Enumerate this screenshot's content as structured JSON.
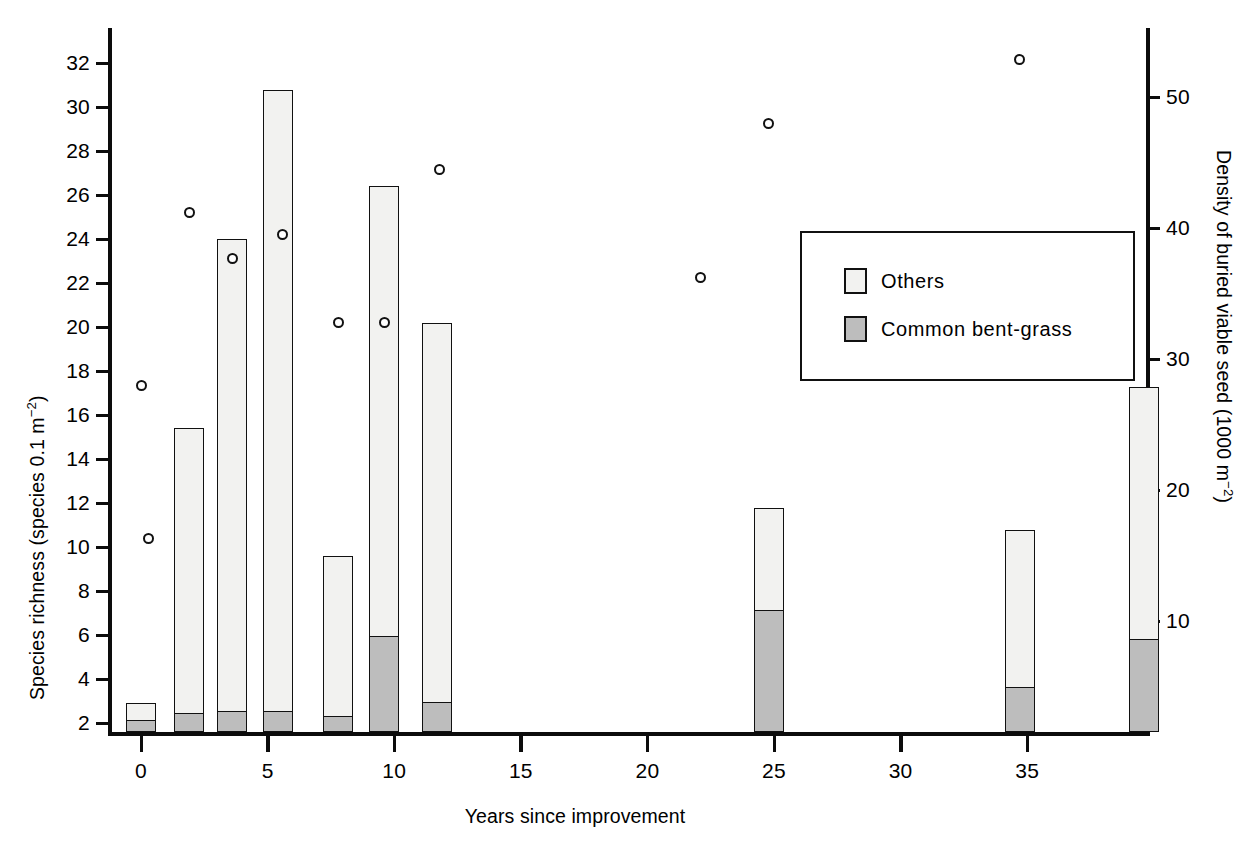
{
  "chart_data": {
    "type": "bar",
    "title": "",
    "xlabel": "Years since improvement",
    "ylabel": "Species richness (species 0.1 m⁻²)",
    "y2label": "Density of buried viable seed (1000 m⁻²)",
    "xlim": [
      -1.5,
      40
    ],
    "ylim": [
      0,
      33
    ],
    "y2lim": [
      0,
      55
    ],
    "grid": false,
    "legend_position": "upper right",
    "xticks": [
      0,
      5,
      10,
      15,
      20,
      25,
      30,
      35
    ],
    "xtick_labels": [
      "0",
      "5",
      "10",
      "15",
      "20",
      "25",
      "30",
      "35"
    ],
    "yticks": [
      2,
      4,
      6,
      8,
      10,
      12,
      14,
      16,
      18,
      20,
      22,
      24,
      26,
      28,
      30,
      32
    ],
    "ytick_labels": [
      "2",
      "4",
      "6",
      "8",
      "10",
      "12",
      "14",
      "16",
      "18",
      "20",
      "22",
      "24",
      "26",
      "28",
      "30",
      "32"
    ],
    "y2ticks": [
      10,
      20,
      30,
      40,
      50
    ],
    "y2tick_labels": [
      "10",
      "20",
      "30",
      "40",
      "50"
    ],
    "series": [
      {
        "name": "Common bent-grass",
        "color": "#bdbdbd",
        "values": [
          0.5,
          0.8,
          0.9,
          0.9,
          0.7,
          4.3,
          1.3,
          5.5,
          2.0,
          4.2
        ]
      },
      {
        "name": "Others",
        "color": "#f2f2f0",
        "values": [
          0.8,
          13.0,
          21.5,
          28.3,
          7.3,
          20.5,
          17.3,
          4.7,
          7.2,
          11.5
        ]
      }
    ],
    "bars": [
      {
        "x": 0.0,
        "total": 1.3,
        "bent_grass": 0.5,
        "others": 0.8
      },
      {
        "x": 1.9,
        "total": 13.8,
        "bent_grass": 0.8,
        "others": 13.0
      },
      {
        "x": 3.6,
        "total": 22.4,
        "bent_grass": 0.9,
        "others": 21.5
      },
      {
        "x": 5.4,
        "total": 29.2,
        "bent_grass": 0.9,
        "others": 28.3
      },
      {
        "x": 7.8,
        "total": 8.0,
        "bent_grass": 0.7,
        "others": 7.3
      },
      {
        "x": 9.6,
        "total": 24.8,
        "bent_grass": 4.3,
        "others": 20.5
      },
      {
        "x": 11.7,
        "total": 18.6,
        "bent_grass": 1.3,
        "others": 17.3
      },
      {
        "x": 24.8,
        "total": 10.2,
        "bent_grass": 5.5,
        "others": 4.7
      },
      {
        "x": 34.7,
        "total": 9.2,
        "bent_grass": 2.0,
        "others": 7.2
      },
      {
        "x": 39.6,
        "total": 15.7,
        "bent_grass": 4.2,
        "others": 11.5
      }
    ],
    "scatter": {
      "name": "Density of buried viable seed",
      "marker": "open-circle",
      "points": [
        {
          "x": 0.0,
          "y_left": 17.0,
          "y_right": 28.0
        },
        {
          "x": 0.3,
          "y_left": 9.9,
          "y_right": 16.3
        },
        {
          "x": 1.9,
          "y_left": 25.0,
          "y_right": 41.2
        },
        {
          "x": 3.6,
          "y_left": 22.9,
          "y_right": 37.7
        },
        {
          "x": 5.6,
          "y_left": 24.0,
          "y_right": 39.5
        },
        {
          "x": 7.8,
          "y_left": 19.9,
          "y_right": 32.8
        },
        {
          "x": 9.6,
          "y_left": 19.9,
          "y_right": 32.8
        },
        {
          "x": 11.8,
          "y_left": 27.0,
          "y_right": 44.5
        },
        {
          "x": 22.1,
          "y_left": 22.0,
          "y_right": 36.2
        },
        {
          "x": 24.8,
          "y_left": 29.1,
          "y_right": 48.0
        },
        {
          "x": 34.7,
          "y_left": 32.1,
          "y_right": 52.9
        }
      ]
    },
    "legend": [
      {
        "label": "Others",
        "swatch": "others"
      },
      {
        "label": "Common bent-grass",
        "swatch": "bent"
      }
    ],
    "colors": {
      "axis": "#0c0c0c",
      "bar_fill_others": "#f2f2f0",
      "bar_fill_bent": "#bdbdbd",
      "marker_edge": "#111111",
      "background": "#ffffff"
    }
  }
}
